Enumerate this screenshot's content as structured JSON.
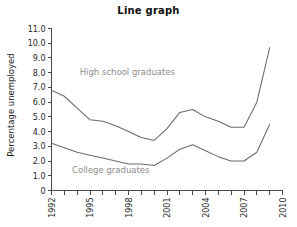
{
  "chart_data": {
    "type": "line",
    "title": "Line graph",
    "xlabel": "",
    "ylabel": "Percentage unemployed",
    "xlim": [
      1992,
      2010
    ],
    "ylim": [
      0,
      11
    ],
    "grid": false,
    "legend_position": "inline-annotations",
    "y_ticks": [
      "0",
      "1.0",
      "2.0",
      "3.0",
      "4.0",
      "5.0",
      "6.0",
      "7.0",
      "8.0",
      "9.0",
      "10.0",
      "11.0"
    ],
    "y_tick_values": [
      0,
      1,
      2,
      3,
      4,
      5,
      6,
      7,
      8,
      9,
      10,
      11
    ],
    "x_ticks_all": [
      1992,
      1993,
      1994,
      1995,
      1996,
      1997,
      1998,
      1999,
      2000,
      2001,
      2002,
      2003,
      2004,
      2005,
      2006,
      2007,
      2008,
      2009,
      2010
    ],
    "x_tick_labels": [
      "1992",
      "1995",
      "1998",
      "2001",
      "2004",
      "2007",
      "2010"
    ],
    "x_tick_label_values": [
      1992,
      1995,
      1998,
      2001,
      2004,
      2007,
      2010
    ],
    "x": [
      1992,
      1993,
      1994,
      1995,
      1996,
      1997,
      1998,
      1999,
      2000,
      2001,
      2002,
      2003,
      2004,
      2005,
      2006,
      2007,
      2008,
      2009
    ],
    "series": [
      {
        "name": "High school graduates",
        "color": "#6b6b6b",
        "label_x": 1994.2,
        "label_y": 7.85,
        "values": [
          6.8,
          6.4,
          5.6,
          4.8,
          4.7,
          4.4,
          4.0,
          3.6,
          3.4,
          4.2,
          5.3,
          5.5,
          5.0,
          4.7,
          4.3,
          4.3,
          6.0,
          9.7
        ]
      },
      {
        "name": "College graduates",
        "color": "#6b6b6b",
        "label_x": 1993.6,
        "label_y": 1.2,
        "values": [
          3.2,
          2.9,
          2.6,
          2.4,
          2.2,
          2.0,
          1.8,
          1.8,
          1.7,
          2.2,
          2.8,
          3.1,
          2.7,
          2.3,
          2.0,
          2.0,
          2.6,
          4.5
        ]
      }
    ]
  }
}
